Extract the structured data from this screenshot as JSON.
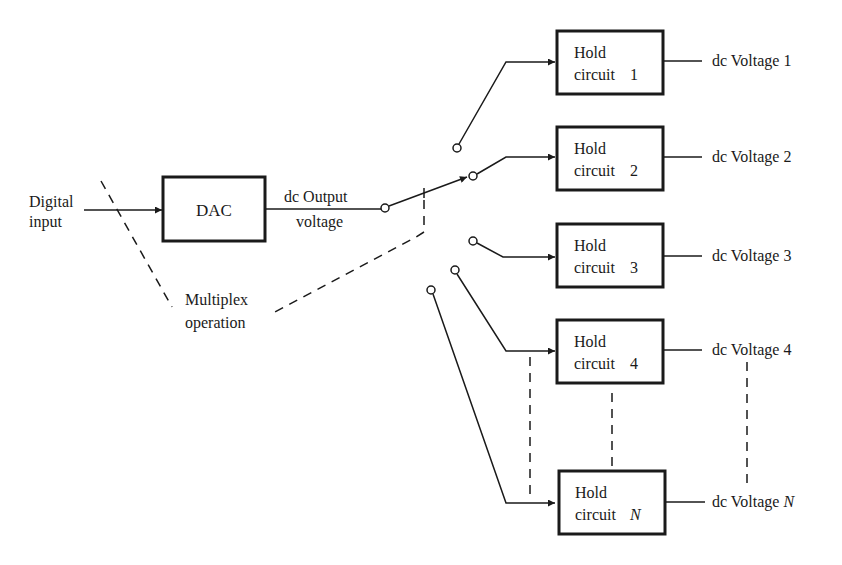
{
  "diagram": {
    "input": {
      "line1": "Digital",
      "line2": "input"
    },
    "dac": {
      "label": "DAC"
    },
    "dac_output": {
      "line1": "dc Output",
      "line2": "voltage"
    },
    "multiplex": {
      "line1": "Multiplex",
      "line2": "operation"
    },
    "hold_circuits": [
      {
        "line1": "Hold",
        "line2": "circuit",
        "index": "1",
        "output": "dc Voltage 1"
      },
      {
        "line1": "Hold",
        "line2": "circuit",
        "index": "2",
        "output": "dc Voltage 2"
      },
      {
        "line1": "Hold",
        "line2": "circuit",
        "index": "3",
        "output": "dc Voltage 3"
      },
      {
        "line1": "Hold",
        "line2": "circuit",
        "index": "4",
        "output": "dc Voltage 4"
      },
      {
        "line1": "Hold",
        "line2": "circuit",
        "index": "N",
        "output_prefix": "dc Voltage ",
        "output_index": "N"
      }
    ]
  }
}
